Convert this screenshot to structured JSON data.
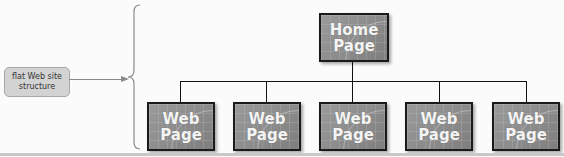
{
  "label": {
    "line1": "flat Web site",
    "line2": "structure"
  },
  "home": {
    "line1": "Home",
    "line2": "Page"
  },
  "pages": [
    {
      "line1": "Web",
      "line2": "Page"
    },
    {
      "line1": "Web",
      "line2": "Page"
    },
    {
      "line1": "Web",
      "line2": "Page"
    },
    {
      "line1": "Web",
      "line2": "Page"
    },
    {
      "line1": "Web",
      "line2": "Page"
    }
  ],
  "colors": {
    "node_fill": "#8e8e8e",
    "node_border": "#1a1a1a",
    "label_fill": "#d3d3d3",
    "connector": "#111111"
  }
}
